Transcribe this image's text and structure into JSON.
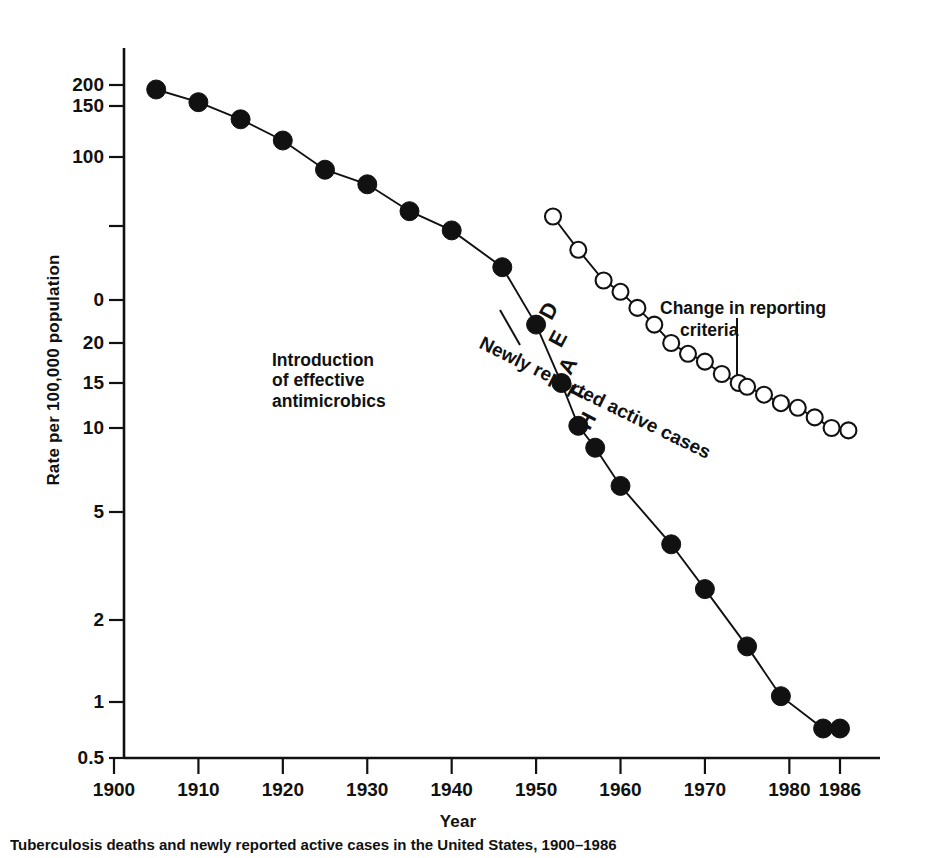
{
  "chart_data": {
    "type": "line",
    "title": "",
    "xlabel": "Year",
    "ylabel": "Rate per 100,000 population",
    "yscale": "log",
    "grid": false,
    "legend_position": "inline-annotations",
    "xlim": [
      1900,
      1988
    ],
    "ylim": [
      0.5,
      230
    ],
    "xticks": [
      "1900",
      "1910",
      "1920",
      "1930",
      "1940",
      "1950",
      "1960",
      "1970",
      "1980",
      "1986"
    ],
    "yticks": [
      "200",
      "150",
      "100",
      "",
      "0",
      "20",
      "15",
      "10",
      "5",
      "2",
      "1",
      "0.5"
    ],
    "series": [
      {
        "name": "DEATHS",
        "marker": "filled-circle",
        "points": [
          {
            "x": 1905,
            "y": 188
          },
          {
            "x": 1910,
            "y": 158
          },
          {
            "x": 1915,
            "y": 135
          },
          {
            "x": 1920,
            "y": 114
          },
          {
            "x": 1925,
            "y": 88
          },
          {
            "x": 1930,
            "y": 76
          },
          {
            "x": 1935,
            "y": 58
          },
          {
            "x": 1940,
            "y": 48
          },
          {
            "x": 1946,
            "y": 34
          },
          {
            "x": 1950,
            "y": 22
          },
          {
            "x": 1953,
            "y": 15
          },
          {
            "x": 1955,
            "y": 10.2
          },
          {
            "x": 1957,
            "y": 8.5
          },
          {
            "x": 1960,
            "y": 6.2
          },
          {
            "x": 1966,
            "y": 3.8
          },
          {
            "x": 1970,
            "y": 2.6
          },
          {
            "x": 1975,
            "y": 1.6
          },
          {
            "x": 1979,
            "y": 1.05
          },
          {
            "x": 1984,
            "y": 0.72
          },
          {
            "x": 1986,
            "y": 0.72
          }
        ]
      },
      {
        "name": "Newly reported active cases",
        "marker": "open-circle",
        "points": [
          {
            "x": 1952,
            "y": 55
          },
          {
            "x": 1955,
            "y": 40
          },
          {
            "x": 1958,
            "y": 30
          },
          {
            "x": 1960,
            "y": 27
          },
          {
            "x": 1962,
            "y": 24
          },
          {
            "x": 1964,
            "y": 22
          },
          {
            "x": 1966,
            "y": 20
          },
          {
            "x": 1968,
            "y": 18.5
          },
          {
            "x": 1970,
            "y": 17.5
          },
          {
            "x": 1972,
            "y": 16
          },
          {
            "x": 1974,
            "y": 15
          },
          {
            "x": 1975,
            "y": 14.5
          },
          {
            "x": 1977,
            "y": 13.5
          },
          {
            "x": 1979,
            "y": 12.5
          },
          {
            "x": 1981,
            "y": 12
          },
          {
            "x": 1983,
            "y": 11
          },
          {
            "x": 1985,
            "y": 10
          },
          {
            "x": 1987,
            "y": 9.8
          }
        ]
      }
    ],
    "annotations": [
      {
        "id": "antimicrobics",
        "text": "Introduction\nof effective\nantimicrobics",
        "leader": true
      },
      {
        "id": "reporting",
        "text": "Change in reporting\ncriteria",
        "leader": true
      },
      {
        "id": "deaths-curve",
        "text": "DEATHS",
        "rotated": true
      },
      {
        "id": "cases-curve",
        "text": "Newly reported active cases",
        "rotated": true
      }
    ]
  },
  "axes": {
    "y_title": "Rate per 100,000 population",
    "x_title": "Year",
    "y_tick_labels": [
      "200",
      "150",
      "100",
      "0",
      "20",
      "15",
      "10",
      "5",
      "2",
      "1",
      "0.5"
    ],
    "x_tick_labels": [
      "1900",
      "1910",
      "1920",
      "1930",
      "1940",
      "1950",
      "1960",
      "1970",
      "1980",
      "1986"
    ]
  },
  "annotations": {
    "antimicrobics": "Introduction\nof effective\nantimicrobics",
    "reporting_line1": "Change in reporting",
    "reporting_line2": "criteria",
    "deaths_label": "DEATHS",
    "cases_label": "Newly reported active cases"
  },
  "caption": "Tuberculosis deaths and newly reported active cases in the United States, 1900–1986",
  "colors": {
    "ink": "#111111",
    "background": "#ffffff",
    "marker_fill": "#111111",
    "open_marker_fill": "#ffffff"
  }
}
